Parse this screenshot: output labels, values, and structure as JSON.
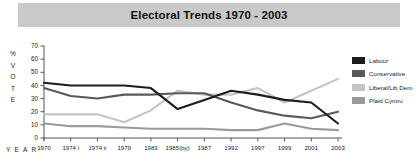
{
  "chart_data": {
    "type": "line",
    "title": "Electoral Trends 1970 - 2003",
    "xlabel": "YEAR",
    "ylabel": "% VOTE",
    "ylim": [
      0,
      70
    ],
    "yticks": [
      0,
      10,
      20,
      30,
      40,
      50,
      60,
      70
    ],
    "grid": false,
    "legend_position": "right",
    "categories": [
      "1970",
      "1974 i",
      "1974 ii",
      "1979",
      "1983",
      "1985(by)",
      "1987",
      "1992",
      "1997",
      "1999",
      "2001",
      "2003"
    ],
    "series": [
      {
        "name": "Labour",
        "color": "#1c1c1c",
        "values": [
          42,
          40,
          40,
          40,
          38,
          22,
          29,
          36,
          33,
          29,
          27,
          11
        ]
      },
      {
        "name": "Conservative",
        "color": "#595959",
        "values": [
          38,
          32,
          30,
          33,
          33,
          34,
          34,
          27,
          21,
          17,
          15,
          20
        ]
      },
      {
        "name": "Liberal/Lib Dem",
        "color": "#c4c4c4",
        "values": [
          18,
          18,
          18,
          12,
          21,
          36,
          33,
          33,
          38,
          27,
          36,
          45
        ]
      },
      {
        "name": "Plaid Cymru",
        "color": "#9a9a9a",
        "values": [
          11,
          9,
          9,
          8,
          7,
          7,
          7,
          6,
          6,
          11,
          7,
          6
        ]
      }
    ]
  },
  "legend": {
    "items": [
      {
        "label": "Labour",
        "color": "#1c1c1c"
      },
      {
        "label": "Conservative",
        "color": "#595959"
      },
      {
        "label": "Liberal/Lib Dem",
        "color": "#c4c4c4"
      },
      {
        "label": "Plaid Cymru",
        "color": "#9a9a9a"
      }
    ]
  },
  "axes": {
    "y_title_chars": "%\nV\nO\nT\nE",
    "x_title": "Y E A R"
  },
  "colors": {
    "title_bar_bg": "#c9c9c9",
    "axis": "#555555",
    "page_bg": "#ffffff"
  }
}
